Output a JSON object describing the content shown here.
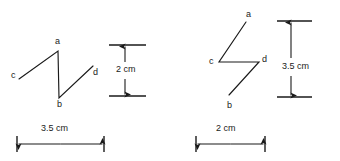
{
  "figure": {
    "type": "geometry-diagram",
    "stroke_color": "#1a1a1a",
    "background_color": "#ffffff",
    "panels": [
      {
        "id": "left-panel",
        "vertex_labels": [
          {
            "id": "a",
            "text": "a",
            "x": 55,
            "y": 39
          },
          {
            "id": "c",
            "text": "c",
            "x": 11,
            "y": 71
          },
          {
            "id": "b",
            "text": "b",
            "x": 57,
            "y": 100
          },
          {
            "id": "d",
            "text": "d",
            "x": 93,
            "y": 70
          }
        ],
        "path_points": [
          {
            "id": "c",
            "x": 19,
            "y": 79
          },
          {
            "id": "a",
            "x": 58,
            "y": 51
          },
          {
            "id": "b",
            "x": 59,
            "y": 98
          },
          {
            "id": "d",
            "x": 93,
            "y": 66
          }
        ],
        "vertical_dimension": {
          "label": "2 cm",
          "label_x": 131,
          "label_y": 70,
          "top_y": 45,
          "bottom_y": 96,
          "arrow_x": 125,
          "tick_left": 109,
          "tick_right": 146
        },
        "horizontal_dimension": {
          "label": "3.5 cm",
          "label_x": 41,
          "label_y": 125,
          "left_x": 17,
          "right_x": 104,
          "arrow_y": 144
        }
      },
      {
        "id": "right-panel",
        "vertex_labels": [
          {
            "id": "a",
            "text": "a",
            "x": 248,
            "y": 11
          },
          {
            "id": "c",
            "text": "c",
            "x": 209,
            "y": 57
          },
          {
            "id": "b",
            "text": "b",
            "x": 227,
            "y": 101
          },
          {
            "id": "d",
            "text": "d",
            "x": 262,
            "y": 56
          }
        ],
        "path_points": [
          {
            "id": "a",
            "x": 246,
            "y": 22
          },
          {
            "id": "c",
            "x": 219,
            "y": 62
          },
          {
            "id": "d",
            "x": 259,
            "y": 62
          },
          {
            "id": "b",
            "x": 229,
            "y": 95
          }
        ],
        "vertical_dimension": {
          "label": "3.5 cm",
          "label_x": 298,
          "label_y": 67,
          "top_y": 21,
          "bottom_y": 97,
          "arrow_x": 291,
          "tick_left": 277,
          "tick_right": 312
        },
        "horizontal_dimension": {
          "label": "2 cm",
          "label_x": 216,
          "label_y": 125,
          "left_x": 196,
          "right_x": 265,
          "arrow_y": 144
        }
      }
    ]
  }
}
